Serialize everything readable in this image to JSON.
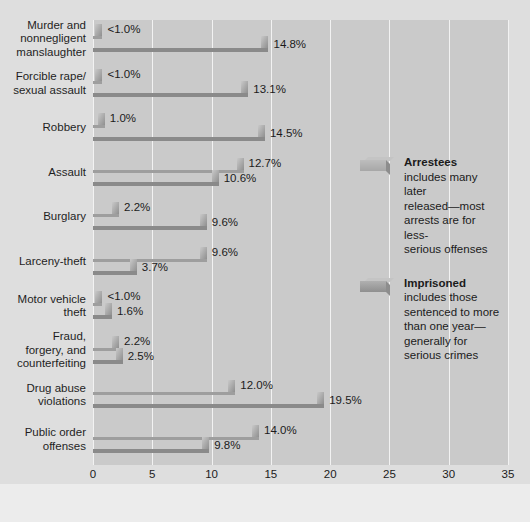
{
  "chart_data": {
    "type": "bar",
    "orientation": "horizontal",
    "title": "",
    "xlabel": "Percent",
    "ylabel": "",
    "xlim": [
      0,
      35
    ],
    "xticks": [
      0,
      5,
      10,
      15,
      20,
      25,
      30,
      35
    ],
    "grid": true,
    "legend_position": "right",
    "categories": [
      "Murder and nonnegligent manslaughter",
      "Forcible rape/ sexual assault",
      "Robbery",
      "Assault",
      "Burglary",
      "Larceny-theft",
      "Motor vehicle theft",
      "Fraud, forgery, and counterfeiting",
      "Drug abuse violations",
      "Public order offenses"
    ],
    "series": [
      {
        "name": "Arrestees",
        "color": "#b4b4b4",
        "values": [
          0.8,
          0.8,
          1.0,
          12.7,
          2.2,
          9.6,
          0.8,
          2.2,
          12.0,
          14.0
        ],
        "labels": [
          "<1.0%",
          "<1.0%",
          "1.0%",
          "12.7%",
          "2.2%",
          "9.6%",
          "<1.0%",
          "2.2%",
          "12.0%",
          "14.0%"
        ]
      },
      {
        "name": "Imprisoned",
        "color": "#9a9a9a",
        "values": [
          14.8,
          13.1,
          14.5,
          10.6,
          9.6,
          3.7,
          1.6,
          2.5,
          19.5,
          9.8
        ],
        "labels": [
          "14.8%",
          "13.1%",
          "14.5%",
          "10.6%",
          "9.6%",
          "3.7%",
          "1.6%",
          "2.5%",
          "19.5%",
          "9.8%"
        ]
      }
    ]
  },
  "categories_display": [
    [
      "Murder and",
      "nonnegligent",
      "manslaughter"
    ],
    [
      "Forcible rape/",
      "sexual assault"
    ],
    [
      "Robbery"
    ],
    [
      "Assault"
    ],
    [
      "Burglary"
    ],
    [
      "Larceny-theft"
    ],
    [
      "Motor vehicle",
      "theft"
    ],
    [
      "Fraud,",
      "forgery, and",
      "counterfeiting"
    ],
    [
      "Drug abuse",
      "violations"
    ],
    [
      "Public order",
      "offenses"
    ]
  ],
  "axis": {
    "x_title": "Percent",
    "ticks": [
      "0",
      "5",
      "10",
      "15",
      "20",
      "25",
      "30",
      "35"
    ]
  },
  "legend": {
    "items": [
      {
        "key": "arrestees",
        "title": "Arrestees",
        "description": "includes many later released—most arrests are for less-serious offenses",
        "lines": [
          "includes many later",
          "released—most",
          "arrests are for less-",
          "serious offenses"
        ],
        "color": "#b4b4b4"
      },
      {
        "key": "imprisoned",
        "title": "Imprisoned",
        "description": "includes those sentenced to more than one year—generally for serious crimes",
        "lines": [
          "includes those",
          "sentenced to more",
          "than one year—",
          "generally for",
          "serious crimes"
        ],
        "color": "#9a9a9a"
      }
    ]
  },
  "colors": {
    "page_background": "#dedede",
    "plot_background": "#cacaca",
    "gridline": "#f2f2f2",
    "arrestees_bar": "#b4b4b4",
    "imprisoned_bar": "#9a9a9a",
    "text": "#1b1b1b"
  }
}
